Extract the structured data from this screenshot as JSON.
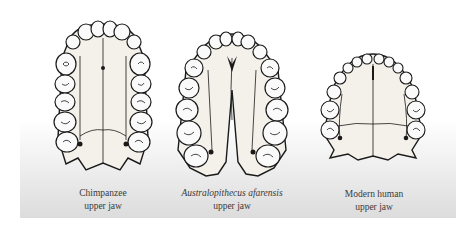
{
  "figure": {
    "panels": [
      {
        "id": "chimpanzee",
        "caption_line1": "Chimpanzee",
        "caption_line2": "upper jaw",
        "italic_line1": false
      },
      {
        "id": "australopithecus",
        "caption_line1": "Australopithecus afarensis",
        "caption_line2": "upper jaw",
        "italic_line1": true
      },
      {
        "id": "modern-human",
        "caption_line1": "Modern human",
        "caption_line2": "upper jaw",
        "italic_line1": false
      }
    ],
    "colors": {
      "ink": "#1a1a1a",
      "bone": "#f4f1ea",
      "background_top": "#ffffff",
      "background_bottom": "#dcdcdc",
      "caption": "#3a3a3a"
    }
  }
}
